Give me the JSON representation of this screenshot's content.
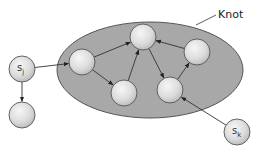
{
  "diagram": {
    "title": "Knot",
    "colors": {
      "knot_fill": "#a8a8a8",
      "knot_stroke": "#555555",
      "node_stroke": "#555555",
      "edge": "#333333",
      "node_light": "#f4f4f4",
      "node_dark": "#bdbdbd"
    },
    "knot": {
      "label": "Knot",
      "cx": 150,
      "cy": 70,
      "rx": 93,
      "ry": 48
    },
    "nodes": [
      {
        "id": "sj",
        "label": "s",
        "sub": "j",
        "cx": 22,
        "cy": 69,
        "r": 13,
        "in_knot": false
      },
      {
        "id": "below_sj",
        "label": "",
        "sub": "",
        "cx": 22,
        "cy": 115,
        "r": 13,
        "in_knot": false
      },
      {
        "id": "k1",
        "label": "",
        "sub": "",
        "cx": 82,
        "cy": 62,
        "r": 13,
        "in_knot": true
      },
      {
        "id": "k2",
        "label": "",
        "sub": "",
        "cx": 143,
        "cy": 37,
        "r": 13,
        "in_knot": true
      },
      {
        "id": "k3",
        "label": "",
        "sub": "",
        "cx": 124,
        "cy": 93,
        "r": 13,
        "in_knot": true
      },
      {
        "id": "k4",
        "label": "",
        "sub": "",
        "cx": 197,
        "cy": 52,
        "r": 13,
        "in_knot": true
      },
      {
        "id": "k5",
        "label": "",
        "sub": "",
        "cx": 170,
        "cy": 90,
        "r": 13,
        "in_knot": true
      },
      {
        "id": "sk",
        "label": "s",
        "sub": "k",
        "cx": 237,
        "cy": 132,
        "r": 13,
        "in_knot": false
      }
    ],
    "edges": [
      {
        "from": "sj",
        "to": "k1"
      },
      {
        "from": "sj",
        "to": "below_sj"
      },
      {
        "from": "k1",
        "to": "k2"
      },
      {
        "from": "k1",
        "to": "k3"
      },
      {
        "from": "k3",
        "to": "k2"
      },
      {
        "from": "k2",
        "to": "k5"
      },
      {
        "from": "k4",
        "to": "k2"
      },
      {
        "from": "k5",
        "to": "k4"
      },
      {
        "from": "sk",
        "to": "k5"
      }
    ],
    "leader_line": {
      "x1": 196,
      "y1": 25,
      "x2": 216,
      "y2": 15
    }
  }
}
